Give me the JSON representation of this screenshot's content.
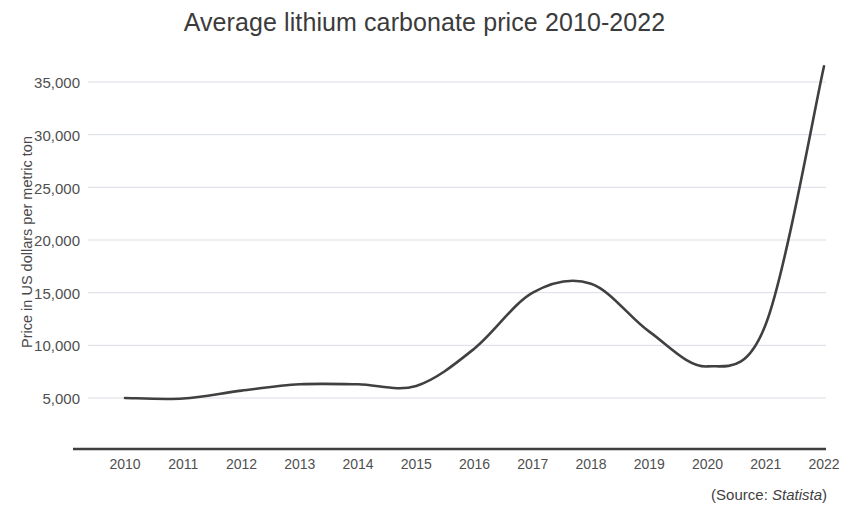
{
  "chart_data": {
    "type": "line",
    "title": "Average lithium carbonate price 2010-2022",
    "xlabel": "",
    "ylabel": "Price in US dollars per metric ton",
    "categories": [
      "2010",
      "2011",
      "2012",
      "2013",
      "2014",
      "2015",
      "2016",
      "2017",
      "2018",
      "2019",
      "2020",
      "2021",
      "2022"
    ],
    "values": [
      5000,
      4950,
      5700,
      6300,
      6300,
      6150,
      9700,
      15000,
      15850,
      11300,
      8000,
      12000,
      36500
    ],
    "series": [
      {
        "name": "Average lithium carbonate price",
        "values": [
          5000,
          4950,
          5700,
          6300,
          6300,
          6150,
          9700,
          15000,
          15850,
          11300,
          8000,
          12000,
          36500
        ]
      }
    ],
    "ylim": [
      0,
      38000
    ],
    "yticks": [
      5000,
      10000,
      15000,
      20000,
      25000,
      30000,
      35000
    ],
    "ytick_labels": [
      "5,000",
      "10,000",
      "15,000",
      "20,000",
      "25,000",
      "30,000",
      "35,000"
    ],
    "grid": true,
    "grid_axis": "y",
    "legend": null,
    "line_color": "#404040",
    "grid_color": "#d9dde4",
    "axis_color": "#3f3f3f",
    "background_color": "#ffffff"
  },
  "title": "Average lithium carbonate price 2010-2022",
  "axes": {
    "y_title": "Price in US dollars per metric ton",
    "y_ticks": [
      "35,000",
      "30,000",
      "25,000",
      "20,000",
      "15,000",
      "10,000",
      "5,000"
    ],
    "x_ticks": [
      "2010",
      "2011",
      "2012",
      "2013",
      "2014",
      "2015",
      "2016",
      "2017",
      "2018",
      "2019",
      "2020",
      "2021",
      "2022"
    ]
  },
  "source": {
    "prefix": "(Source: ",
    "name": "Statista",
    "suffix": ")"
  }
}
